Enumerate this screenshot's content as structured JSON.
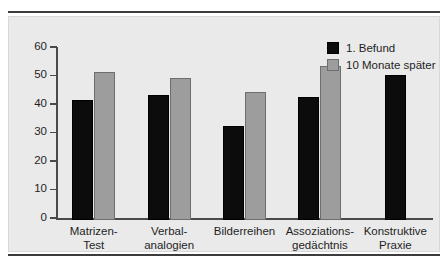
{
  "chart_data": {
    "type": "bar",
    "title": "",
    "subtitle": "",
    "xlabel": "",
    "ylabel": "",
    "ylim": [
      0,
      60
    ],
    "yticks": [
      "0",
      "10",
      "20",
      "30",
      "40",
      "50",
      "60"
    ],
    "ytick_values": [
      0,
      10,
      20,
      30,
      40,
      50,
      60
    ],
    "grid": false,
    "legend_position": "top-right",
    "categories": [
      "Matrizen-\nTest",
      "Verbal-\nanalogien",
      "Bilderreihen",
      "Assoziations-\ngedächtnis",
      "Konstruktive\nPraxie"
    ],
    "category_lines": [
      [
        "Matrizen-",
        "Test"
      ],
      [
        "Verbal-",
        "analogien"
      ],
      [
        "Bilderreihen",
        ""
      ],
      [
        "Assoziations-",
        "gedächtnis"
      ],
      [
        "Konstruktive",
        "Praxie"
      ]
    ],
    "series": [
      {
        "name": "1. Befund",
        "color": "#0c0c0c",
        "values": [
          42,
          44,
          33,
          43,
          51
        ]
      },
      {
        "name": "10 Monate später",
        "color": "#9d9d9d",
        "values": [
          52,
          50,
          45,
          54,
          null
        ]
      }
    ]
  },
  "legend": {
    "items": [
      {
        "label": "1. Befund",
        "swatch": "dark"
      },
      {
        "label": "10 Monate später",
        "swatch": "light"
      }
    ]
  },
  "colors": {
    "panel_background": "#eaeaea",
    "page_background": "#ffffff",
    "rule": "#3c3c3c",
    "axis": "#4a4a4a",
    "series_1": "#0c0c0c",
    "series_2": "#9d9d9d",
    "text": "#1f1f1f"
  }
}
